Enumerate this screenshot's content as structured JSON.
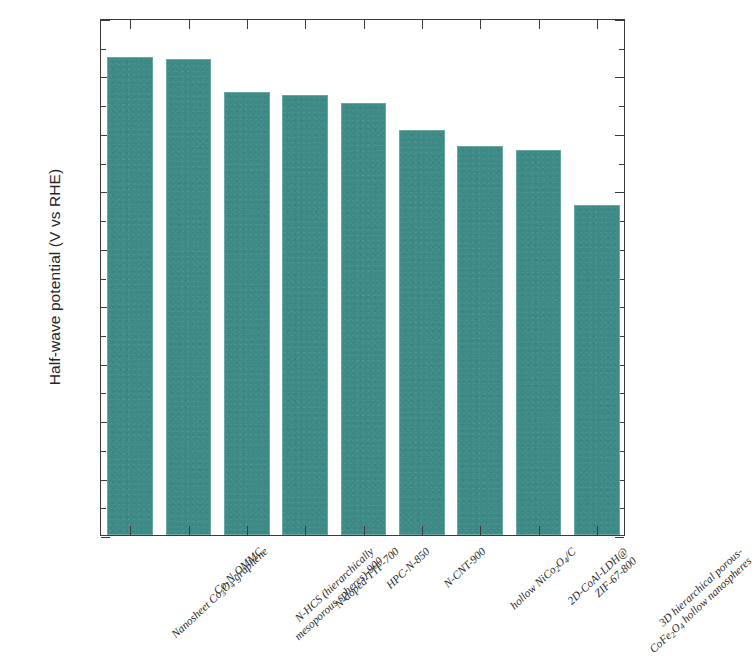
{
  "chart_data": {
    "type": "bar",
    "title": "",
    "xlabel": "",
    "ylabel": "Half-wave potential (V vs RHE)",
    "ylim": [
      0.0,
      0.9
    ],
    "ytick_labels": [
      "0.0",
      "0.1",
      "0.2",
      "0.3",
      "0.4",
      "0.5",
      "0.6",
      "0.7",
      "0.8",
      "0.9"
    ],
    "ytick_values": [
      0.0,
      0.1,
      0.2,
      0.3,
      0.4,
      0.5,
      0.6,
      0.7,
      0.8,
      0.9
    ],
    "grid": false,
    "legend": "none",
    "bar_color": "#3e8a87",
    "categories": [
      "Nanosheet Co3O4-graphene",
      "Co-N-OMMC",
      "N-HCS (hierarchically mesoporous spheres)-900",
      "N-doped-TTF-700",
      "HPC-N-850",
      "N-CNT-900",
      "hollow NiCo2O4/C",
      "2D-CoAl-LDH@ZIF-67-800",
      "3D hierarchical porous-CoFe2O4 hollow nanospheres"
    ],
    "values": [
      0.832,
      0.828,
      0.772,
      0.766,
      0.752,
      0.705,
      0.678,
      0.671,
      0.575
    ]
  },
  "axis": {
    "y_title": "Half-wave potential (V vs RHE)",
    "y_ticks": [
      "0.9",
      "0.8",
      "0.7",
      "0.6",
      "0.5",
      "0.4",
      "0.3",
      "0.2",
      "0.1",
      "0.0"
    ]
  },
  "x_labels": [
    {
      "line1": "Nanosheet Co",
      "sub1": "3",
      "mid1": "O",
      "sub2": "4",
      "tail1": "-graphene",
      "line2": ""
    },
    {
      "line1": "Co-N-OMMC",
      "sub1": "",
      "mid1": "",
      "sub2": "",
      "tail1": "",
      "line2": ""
    },
    {
      "line1": "N-HCS (hierarchically",
      "sub1": "",
      "mid1": "",
      "sub2": "",
      "tail1": "",
      "line2": "mesoporous spheres)-900"
    },
    {
      "line1": "N-doped-TTF-700",
      "sub1": "",
      "mid1": "",
      "sub2": "",
      "tail1": "",
      "line2": ""
    },
    {
      "line1": "HPC-N-850",
      "sub1": "",
      "mid1": "",
      "sub2": "",
      "tail1": "",
      "line2": ""
    },
    {
      "line1": "N-CNT-900",
      "sub1": "",
      "mid1": "",
      "sub2": "",
      "tail1": "",
      "line2": ""
    },
    {
      "line1": "hollow NiCo",
      "sub1": "2",
      "mid1": "O",
      "sub2": "4",
      "tail1": "/C",
      "line2": ""
    },
    {
      "line1": "2D-CoAl-LDH@",
      "sub1": "",
      "mid1": "",
      "sub2": "",
      "tail1": "",
      "line2": "ZIF-67-800"
    },
    {
      "line1": "3D hierarchical porous-",
      "sub1": "",
      "mid1": "",
      "sub2": "",
      "tail1": "",
      "line2": "CoFe|2|O|4| hollow nanospheres"
    }
  ]
}
